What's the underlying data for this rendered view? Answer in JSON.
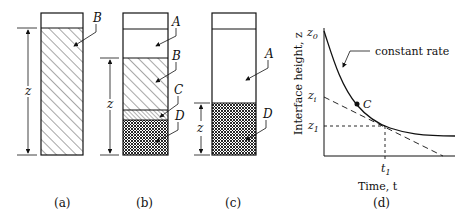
{
  "panels": {
    "a": {
      "caption": "(a)",
      "labels": {
        "B": "B"
      },
      "dimension": "z"
    },
    "b": {
      "caption": "(b)",
      "labels": {
        "A": "A",
        "B": "B",
        "C": "C",
        "D": "D"
      },
      "dimension": "z"
    },
    "c": {
      "caption": "(c)",
      "labels": {
        "A": "A",
        "D": "D"
      },
      "dimension": "z"
    },
    "d": {
      "caption": "(d)",
      "ylabel": "Interface height, z",
      "xlabel": "Time, t",
      "annotation": "constant rate",
      "point_label": "C",
      "y_ticks": {
        "z0": "z",
        "z0_sub": "0",
        "zi": "z",
        "zi_sub": "i",
        "z1": "z",
        "z1_sub": "1"
      },
      "x_ticks": {
        "t1": "t",
        "t1_sub": "1"
      }
    }
  },
  "colors": {
    "ink": "#111111",
    "background": "#ffffff"
  }
}
